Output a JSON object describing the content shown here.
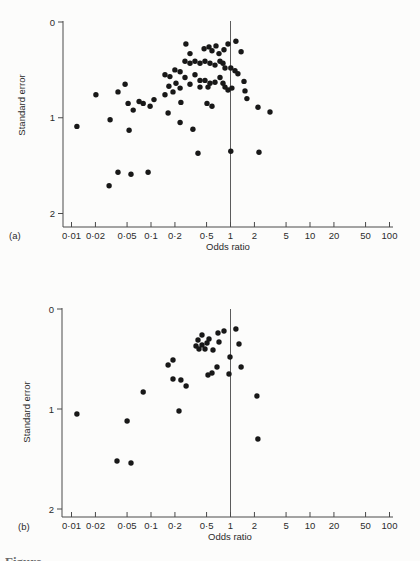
{
  "figure": {
    "caption_fragment": "Figure",
    "background": "#fcfcfb",
    "ink": "#181818",
    "axis_color": "#4a4a4a"
  },
  "chart_data": [
    {
      "type": "scatter",
      "panel_label": "(a)",
      "xlabel": "Odds ratio",
      "ylabel": "Standard error",
      "x_scale": "log",
      "xlim": [
        0.01,
        100
      ],
      "ylim_top_to_bottom": [
        0,
        2
      ],
      "grid": false,
      "ref_line_at_or": 1,
      "x_ticks": {
        "values": [
          0.01,
          0.02,
          0.05,
          0.1,
          0.2,
          0.5,
          1,
          2,
          5,
          10,
          20,
          50,
          100
        ],
        "labels": [
          "0·01",
          "0·02",
          "0·05",
          "0·1",
          "0·2",
          "0·5",
          "1",
          "2",
          "5",
          "10",
          "20",
          "50",
          "100"
        ]
      },
      "y_ticks": {
        "values": [
          0,
          1,
          2
        ],
        "labels": [
          "0",
          "1",
          "2"
        ]
      },
      "points_or_se": [
        [
          0.275,
          0.23
        ],
        [
          0.465,
          0.28
        ],
        [
          0.537,
          0.26
        ],
        [
          0.585,
          0.3
        ],
        [
          0.657,
          0.25
        ],
        [
          0.716,
          0.33
        ],
        [
          0.829,
          0.29
        ],
        [
          0.93,
          0.23
        ],
        [
          1.17,
          0.2
        ],
        [
          1.36,
          0.31
        ],
        [
          0.309,
          0.33
        ],
        [
          0.268,
          0.41
        ],
        [
          0.309,
          0.43
        ],
        [
          0.358,
          0.41
        ],
        [
          0.413,
          0.43
        ],
        [
          0.478,
          0.41
        ],
        [
          0.553,
          0.43
        ],
        [
          0.638,
          0.45
        ],
        [
          0.738,
          0.41
        ],
        [
          0.805,
          0.43
        ],
        [
          1.01,
          0.48
        ],
        [
          1.14,
          0.51
        ],
        [
          0.15,
          0.55
        ],
        [
          0.173,
          0.57
        ],
        [
          0.2,
          0.5
        ],
        [
          0.232,
          0.52
        ],
        [
          0.268,
          0.58
        ],
        [
          0.358,
          0.55
        ],
        [
          0.413,
          0.61
        ],
        [
          0.478,
          0.61
        ],
        [
          0.738,
          0.58
        ],
        [
          0.853,
          0.48
        ],
        [
          0.168,
          0.67
        ],
        [
          0.206,
          0.64
        ],
        [
          0.232,
          0.69
        ],
        [
          0.309,
          0.65
        ],
        [
          0.413,
          0.68
        ],
        [
          0.521,
          0.68
        ],
        [
          0.553,
          0.64
        ],
        [
          0.638,
          0.63
        ],
        [
          0.805,
          0.64
        ],
        [
          0.853,
          0.68
        ],
        [
          0.93,
          0.71
        ],
        [
          1.04,
          0.69
        ],
        [
          1.24,
          0.54
        ],
        [
          1.48,
          0.62
        ],
        [
          0.238,
          0.84
        ],
        [
          0.507,
          0.85
        ],
        [
          0.585,
          0.88
        ],
        [
          1.52,
          0.72
        ],
        [
          1.61,
          0.8
        ],
        [
          2.22,
          0.89
        ],
        [
          3.14,
          0.94
        ],
        [
          0.0117,
          1.09
        ],
        [
          0.0203,
          0.76
        ],
        [
          0.0306,
          1.02
        ],
        [
          0.0385,
          0.73
        ],
        [
          0.0472,
          0.65
        ],
        [
          0.0515,
          0.85
        ],
        [
          0.0597,
          0.92
        ],
        [
          0.0708,
          0.83
        ],
        [
          0.0797,
          0.85
        ],
        [
          0.0975,
          0.88
        ],
        [
          0.053,
          1.13
        ],
        [
          0.109,
          0.81
        ],
        [
          0.15,
          0.76
        ],
        [
          0.189,
          0.73
        ],
        [
          0.164,
          0.95
        ],
        [
          0.232,
          1.05
        ],
        [
          0.337,
          1.12
        ],
        [
          0.39,
          1.37
        ],
        [
          0.0297,
          1.71
        ],
        [
          0.0385,
          1.57
        ],
        [
          0.0561,
          1.59
        ],
        [
          0.092,
          1.57
        ],
        [
          1.01,
          1.35
        ],
        [
          2.28,
          1.36
        ]
      ]
    },
    {
      "type": "scatter",
      "panel_label": "(b)",
      "xlabel": "Odds ratio",
      "ylabel": "Standard error",
      "x_scale": "log",
      "xlim": [
        0.01,
        100
      ],
      "ylim_top_to_bottom": [
        0,
        2
      ],
      "grid": false,
      "ref_line_at_or": 1,
      "x_ticks": {
        "values": [
          0.01,
          0.02,
          0.05,
          0.1,
          0.2,
          0.5,
          1,
          2,
          5,
          10,
          20,
          50,
          100
        ],
        "labels": [
          "0·01",
          "0·02",
          "0·05",
          "0·1",
          "0·2",
          "0·5",
          "1",
          "2",
          "5",
          "10",
          "20",
          "50",
          "100"
        ]
      },
      "y_ticks": {
        "values": [
          0,
          1,
          2
        ],
        "labels": [
          "0",
          "1",
          "2"
        ]
      },
      "points_or_se": [
        [
          0.0117,
          1.05
        ],
        [
          0.0374,
          1.52
        ],
        [
          0.0561,
          1.54
        ],
        [
          0.0501,
          1.12
        ],
        [
          0.0797,
          0.83
        ],
        [
          0.164,
          0.56
        ],
        [
          0.189,
          0.51
        ],
        [
          0.189,
          0.7
        ],
        [
          0.238,
          0.71
        ],
        [
          0.225,
          1.02
        ],
        [
          0.276,
          0.77
        ],
        [
          0.368,
          0.37
        ],
        [
          0.39,
          0.31
        ],
        [
          0.438,
          0.26
        ],
        [
          0.438,
          0.36
        ],
        [
          0.506,
          0.34
        ],
        [
          0.537,
          0.3
        ],
        [
          0.478,
          0.4
        ],
        [
          0.402,
          0.4
        ],
        [
          0.603,
          0.41
        ],
        [
          0.696,
          0.24
        ],
        [
          0.716,
          0.33
        ],
        [
          0.828,
          0.22
        ],
        [
          0.677,
          0.58
        ],
        [
          0.585,
          0.64
        ],
        [
          0.521,
          0.66
        ],
        [
          0.986,
          0.48
        ],
        [
          0.958,
          0.65
        ],
        [
          1.17,
          0.2
        ],
        [
          1.28,
          0.35
        ],
        [
          1.36,
          0.58
        ],
        [
          2.15,
          0.87
        ],
        [
          2.21,
          1.3
        ]
      ]
    }
  ]
}
